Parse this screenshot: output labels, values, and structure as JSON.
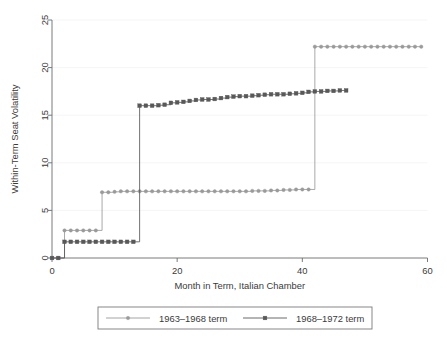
{
  "chart_data": {
    "type": "line",
    "title": "",
    "xlabel": "Month in Term, Italian Chamber",
    "ylabel": "Within-Term Seat Volatility",
    "xlim": [
      0,
      60
    ],
    "ylim": [
      0,
      25
    ],
    "xticks": [
      0,
      20,
      40,
      60
    ],
    "xtick_labels": [
      "0",
      "20",
      "40",
      "60"
    ],
    "yticks": [
      0,
      5,
      10,
      15,
      20,
      25
    ],
    "ytick_labels": [
      "0",
      "5",
      "10",
      "15",
      "20",
      "25"
    ],
    "grid": "horizontal-faint",
    "legend_position": "below-axes",
    "step_style": "step-post",
    "series": [
      {
        "name": "1963–1968 term",
        "color": "#9a9a9a",
        "marker": "circle",
        "x": [
          0,
          1,
          2,
          3,
          4,
          5,
          6,
          7,
          8,
          9,
          10,
          11,
          12,
          13,
          14,
          15,
          16,
          17,
          18,
          19,
          20,
          21,
          22,
          23,
          24,
          25,
          26,
          27,
          28,
          29,
          30,
          31,
          32,
          33,
          34,
          35,
          36,
          37,
          38,
          39,
          40,
          41,
          42,
          43,
          44,
          45,
          46,
          47,
          48,
          49,
          50,
          51,
          52,
          53,
          54,
          55,
          56,
          57,
          58,
          59
        ],
        "y": [
          0.0,
          0.0,
          2.9,
          2.9,
          2.9,
          2.9,
          2.9,
          2.9,
          6.9,
          6.9,
          6.95,
          7.0,
          7.0,
          7.0,
          7.0,
          7.0,
          7.0,
          7.0,
          7.0,
          7.0,
          7.0,
          7.0,
          7.0,
          7.0,
          7.0,
          7.0,
          7.0,
          7.0,
          7.0,
          7.0,
          7.0,
          7.0,
          7.05,
          7.05,
          7.05,
          7.1,
          7.1,
          7.15,
          7.15,
          7.2,
          7.2,
          7.2,
          22.2,
          22.2,
          22.2,
          22.2,
          22.2,
          22.2,
          22.2,
          22.2,
          22.2,
          22.2,
          22.2,
          22.2,
          22.2,
          22.2,
          22.2,
          22.2,
          22.2,
          22.2
        ]
      },
      {
        "name": "1968–1972 term",
        "color": "#595959",
        "marker": "square",
        "x": [
          0,
          1,
          2,
          3,
          4,
          5,
          6,
          7,
          8,
          9,
          10,
          11,
          12,
          13,
          14,
          15,
          16,
          17,
          18,
          19,
          20,
          21,
          22,
          23,
          24,
          25,
          26,
          27,
          28,
          29,
          30,
          31,
          32,
          33,
          34,
          35,
          36,
          37,
          38,
          39,
          40,
          41,
          42,
          43,
          44,
          45,
          46,
          47
        ],
        "y": [
          0.0,
          0.0,
          1.7,
          1.7,
          1.7,
          1.7,
          1.7,
          1.7,
          1.7,
          1.7,
          1.7,
          1.7,
          1.7,
          1.7,
          16.0,
          16.0,
          16.0,
          16.05,
          16.1,
          16.3,
          16.35,
          16.4,
          16.5,
          16.6,
          16.65,
          16.65,
          16.7,
          16.8,
          16.9,
          16.95,
          17.0,
          17.0,
          17.05,
          17.1,
          17.15,
          17.2,
          17.2,
          17.2,
          17.25,
          17.3,
          17.35,
          17.45,
          17.5,
          17.5,
          17.55,
          17.55,
          17.6,
          17.6
        ]
      }
    ]
  },
  "legend": {
    "entries": [
      {
        "label": "1963–1968 term",
        "color": "#9a9a9a",
        "marker": "circle"
      },
      {
        "label": "1968–1972 term",
        "color": "#595959",
        "marker": "square"
      }
    ]
  }
}
